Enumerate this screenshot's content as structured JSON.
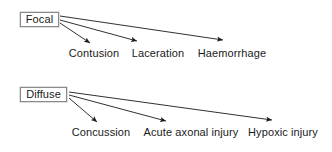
{
  "diagram": {
    "type": "flowchart",
    "canvas": {
      "width": 332,
      "height": 152,
      "background": "#ffffff"
    },
    "style": {
      "box_border_color": "#8a8a8a",
      "box_fill_color": "#ffffff",
      "text_color": "#1a1a1a",
      "arrow_color": "#1a1a1a"
    },
    "groups": [
      {
        "id": "focal",
        "root": {
          "label": "Focal",
          "x": 20,
          "y": 12,
          "width": 39,
          "height": 15
        },
        "children": [
          {
            "label": "Contusion",
            "label_x": 94,
            "label_y": 48,
            "tip_x": 90,
            "tip_y": 43,
            "src_x": 60,
            "src_y": 23
          },
          {
            "label": "Laceration",
            "label_x": 158,
            "label_y": 48,
            "tip_x": 137,
            "tip_y": 41,
            "src_x": 60,
            "src_y": 20
          },
          {
            "label": "Haemorrhage",
            "label_x": 232,
            "label_y": 48,
            "tip_x": 223,
            "tip_y": 40,
            "src_x": 60,
            "src_y": 16
          }
        ]
      },
      {
        "id": "diffuse",
        "root": {
          "label": "Diffuse",
          "x": 20,
          "y": 87,
          "width": 47,
          "height": 15
        },
        "children": [
          {
            "label": "Concussion",
            "label_x": 101,
            "label_y": 127,
            "tip_x": 97,
            "tip_y": 122,
            "src_x": 69,
            "src_y": 98
          },
          {
            "label": "Acute axonal injury",
            "label_x": 191,
            "label_y": 127,
            "tip_x": 166,
            "tip_y": 121,
            "src_x": 69,
            "src_y": 95
          },
          {
            "label": "Hypoxic injury",
            "label_x": 283,
            "label_y": 127,
            "tip_x": 272,
            "tip_y": 120,
            "src_x": 69,
            "src_y": 92
          }
        ]
      }
    ]
  }
}
